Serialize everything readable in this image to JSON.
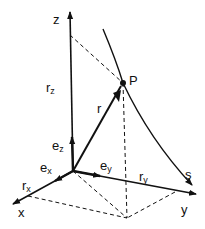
{
  "diagram": {
    "labels": {
      "z_axis": "z",
      "x_axis": "x",
      "y_axis": "y",
      "point": "P",
      "curve": "s",
      "position_vector": "r",
      "r_z_main": "r",
      "r_z_sub": "z",
      "r_x_main": "r",
      "r_x_sub": "x",
      "r_y_main": "r",
      "r_y_sub": "y",
      "e_z_main": "e",
      "e_z_sub": "z",
      "e_x_main": "e",
      "e_x_sub": "x",
      "e_y_main": "e",
      "e_y_sub": "y"
    },
    "colors": {
      "ink": "#111111",
      "background": "#ffffff"
    }
  }
}
